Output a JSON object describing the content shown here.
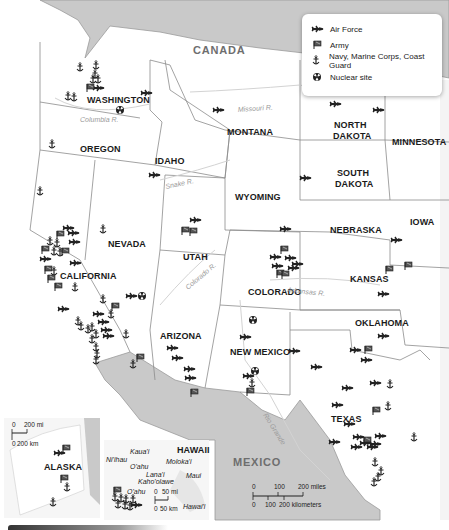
{
  "legend": {
    "items": [
      {
        "icon": "air-force-jet-icon",
        "label": "Air Force"
      },
      {
        "icon": "army-flag-icon",
        "label": "Army"
      },
      {
        "icon": "navy-anchor-icon",
        "label": "Navy, Marine Corps, Coast Guard"
      },
      {
        "icon": "nuclear-site-icon",
        "label": "Nuclear site"
      }
    ]
  },
  "countries": {
    "canada": "CANADA",
    "mexico": "MEXICO"
  },
  "states": {
    "washington": "WASHINGTON",
    "oregon": "OREGON",
    "idaho": "IDAHO",
    "montana": "MONTANA",
    "wyoming": "WYOMING",
    "north_dakota_1": "NORTH",
    "north_dakota_2": "DAKOTA",
    "south_dakota_1": "SOUTH",
    "south_dakota_2": "DAKOTA",
    "minnesota": "MINNESOTA",
    "iowa": "IOWA",
    "nebraska": "NEBRASKA",
    "kansas": "KANSAS",
    "oklahoma": "OKLAHOMA",
    "texas": "TEXAS",
    "new_mexico": "NEW MEXICO",
    "colorado": "COLORADO",
    "utah": "UTAH",
    "arizona": "ARIZONA",
    "nevada": "NEVADA",
    "california": "CALIFORNIA",
    "alaska": "ALASKA",
    "hawaii": "HAWAII"
  },
  "rivers": {
    "columbia": "Columbia R.",
    "missouri": "Missouri R.",
    "snake": "Snake R.",
    "colorado": "Colorado R.",
    "arkansas": "Arkansas R.",
    "rio_grande": "Rio Grande"
  },
  "hawaii_islands": {
    "kauai": "Kaua'i",
    "niihau": "Ni'ihau",
    "oahu": "O'ahu",
    "molokai": "Moloka'i",
    "lanai": "Lana'i",
    "kahoolawe": "Kaho'olawe",
    "maui": "Maui",
    "hawaii": "Hawai'i",
    "oahu_inset": "O'ahu"
  },
  "scales": {
    "main": {
      "miles_0": "0",
      "miles_100": "100",
      "miles_200": "200 miles",
      "km_0": "0",
      "km_100": "100",
      "km_200": "200 kilometers"
    },
    "alaska": {
      "mi_0": "0",
      "mi_200": "200 mi",
      "km_0": "0",
      "km_200": "200 km"
    },
    "hawaii": {
      "mi_0": "0",
      "mi_50": "50 mi",
      "km_0": "0",
      "km_50": "50 km"
    }
  },
  "colors": {
    "land": "#ffffff",
    "foreign": "#c9c9c9",
    "border": "#8c8c8c",
    "river": "#cfcfcf",
    "symbol": "#222222"
  }
}
